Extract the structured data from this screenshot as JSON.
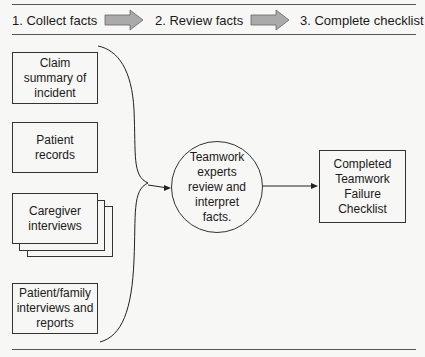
{
  "header": {
    "steps": [
      {
        "label": "1.  Collect facts"
      },
      {
        "label": "2.  Review facts"
      },
      {
        "label": "3.  Complete checklist"
      }
    ],
    "arrow_color": "#a9a9a9"
  },
  "inputs": [
    {
      "label": "Claim\nsummary of\nincident"
    },
    {
      "label": "Patient\nrecords"
    },
    {
      "label": "Caregiver\ninterviews",
      "stacked": true
    },
    {
      "label": "Patient/family\ninterviews and\nreports"
    }
  ],
  "process": {
    "label": "Teamwork\nexperts\nreview and\ninterpret\nfacts."
  },
  "output": {
    "label": "Completed\nTeamwork\nFailure\nChecklist"
  }
}
